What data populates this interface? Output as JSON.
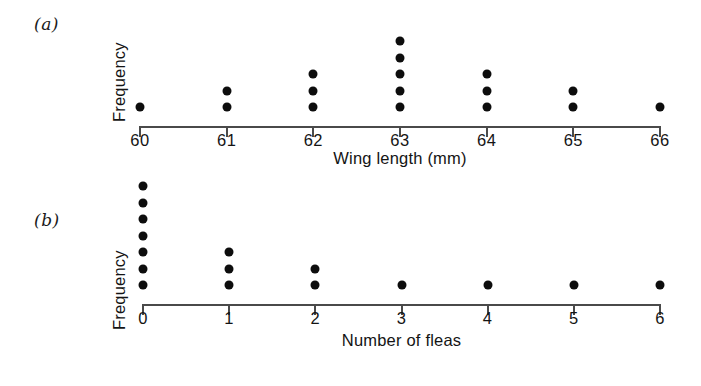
{
  "figure": {
    "panels": [
      {
        "tag": "(a)",
        "name": "panel-a",
        "ylabel": "Frequency",
        "xlabel": "Wing length (mm)",
        "axis_color": "#4a4a4a",
        "dot_color": "#0d0d0d",
        "chart": {
          "type": "scatter",
          "plot_kind": "dot-plot",
          "title": "",
          "xlabel": "Wing length (mm)",
          "ylabel": "Frequency",
          "categories": [
            "60",
            "61",
            "62",
            "63",
            "64",
            "65",
            "66"
          ],
          "values": [
            1,
            2,
            3,
            5,
            3,
            2,
            1
          ],
          "tick_labels": [
            "60",
            "61",
            "62",
            "63",
            "64",
            "65",
            "66"
          ],
          "xlim": [
            59.5,
            66.5
          ],
          "ylim": [
            0,
            5
          ],
          "grid": false,
          "legend": "none",
          "notes": "Each dot represents one observation; dots stack upward from the axis."
        }
      },
      {
        "tag": "(b)",
        "name": "panel-b",
        "ylabel": "Frequency",
        "xlabel": "Number of fleas",
        "axis_color": "#4a4a4a",
        "dot_color": "#0d0d0d",
        "chart": {
          "type": "scatter",
          "plot_kind": "dot-plot",
          "title": "",
          "xlabel": "Number of fleas",
          "ylabel": "Frequency",
          "categories": [
            "0",
            "1",
            "2",
            "3",
            "4",
            "5",
            "6"
          ],
          "values": [
            7,
            3,
            2,
            1,
            1,
            1,
            1
          ],
          "tick_labels": [
            "0",
            "1",
            "2",
            "3",
            "4",
            "5",
            "6"
          ],
          "xlim": [
            -0.5,
            6.5
          ],
          "ylim": [
            0,
            7
          ],
          "grid": false,
          "legend": "none",
          "notes": "Each dot represents one observation; dots stack upward from the axis."
        }
      }
    ]
  },
  "chart_data": [
    {
      "type": "scatter",
      "plot_kind": "dot-plot",
      "panel": "(a)",
      "title": "",
      "xlabel": "Wing length (mm)",
      "ylabel": "Frequency",
      "categories": [
        "60",
        "61",
        "62",
        "63",
        "64",
        "65",
        "66"
      ],
      "x": [
        60,
        61,
        62,
        63,
        64,
        65,
        66
      ],
      "values": [
        1,
        2,
        3,
        5,
        3,
        2,
        1
      ],
      "xlim": [
        59.5,
        66.5
      ],
      "ylim": [
        0,
        5
      ],
      "grid": false,
      "legend": "none"
    },
    {
      "type": "scatter",
      "plot_kind": "dot-plot",
      "panel": "(b)",
      "title": "",
      "xlabel": "Number of fleas",
      "ylabel": "Frequency",
      "categories": [
        "0",
        "1",
        "2",
        "3",
        "4",
        "5",
        "6"
      ],
      "x": [
        0,
        1,
        2,
        3,
        4,
        5,
        6
      ],
      "values": [
        7,
        3,
        2,
        1,
        1,
        1,
        1
      ],
      "xlim": [
        -0.5,
        6.5
      ],
      "ylim": [
        0,
        7
      ],
      "grid": false,
      "legend": "none"
    }
  ]
}
